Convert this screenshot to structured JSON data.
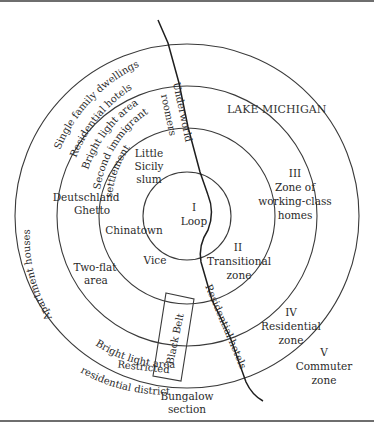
{
  "diagram": {
    "type": "concentric-zone-model",
    "colors": {
      "line": "#3a3a3a",
      "text": "#2a2a2a",
      "background": "#ffffff",
      "rule": "#6e6e6e"
    },
    "zones": [
      {
        "numeral": "I",
        "name": "Loop"
      },
      {
        "numeral": "II",
        "name": "Transitional",
        "name2": "zone"
      },
      {
        "numeral": "III",
        "name": "Zone of",
        "name2": "working-class",
        "name3": "homes"
      },
      {
        "numeral": "IV",
        "name": "Residential",
        "name2": "zone"
      },
      {
        "numeral": "V",
        "name": "Commuter",
        "name2": "zone"
      }
    ],
    "lake": "LAKE MICHIGAN",
    "curved_labels": {
      "single_family": "Single family dwellings",
      "residential_hotels_top": "Residential hotels",
      "bright_light_top": "Bright light area",
      "second_immigrant_1": "Second immigrant",
      "second_immigrant_2": "settlement",
      "apartment_houses": "Apartment houses",
      "bright_light_bottom": "Bright light area",
      "restricted_1": "Restricted",
      "restricted_2": "residential district"
    },
    "vertical_labels": {
      "underworld": "Underworld",
      "roomers": "roomers",
      "black_belt": "Black Belt",
      "residential_hotels_shore": "Residential hotels"
    },
    "area_labels": {
      "little_sicily_1": "Little",
      "little_sicily_2": "Sicily",
      "little_sicily_3": "slum",
      "deutschland_1": "Deutschland",
      "deutschland_2": "Ghetto",
      "chinatown": "Chinatown",
      "vice": "Vice",
      "two_flat_1": "Two-flat",
      "two_flat_2": "area",
      "bungalow_1": "Bungalow",
      "bungalow_2": "section"
    }
  }
}
